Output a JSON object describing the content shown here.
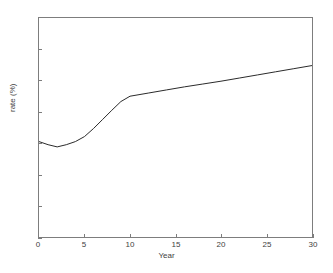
{
  "chart_data": {
    "type": "line",
    "title": "",
    "xlabel": "Year",
    "ylabel": "rate (%)",
    "xlim": [
      0,
      30
    ],
    "ylim": [
      4.7,
      5.4
    ],
    "grid": false,
    "legend": null,
    "line_color": "#2b2b2b",
    "axis_color": "#7d7d7d",
    "background_color": "#ffffff",
    "xticks": [
      0,
      5,
      10,
      15,
      20,
      25,
      30
    ],
    "xticklabels": [
      "0",
      "5",
      "10",
      "15",
      "20",
      "25",
      "30"
    ],
    "yticks": [
      4.7,
      4.8,
      4.9,
      5.0,
      5.1,
      5.2,
      5.3,
      5.4
    ],
    "yticklabels": [
      "4.7",
      "4.8",
      "4.9",
      "5",
      "5.1",
      "5.2",
      "5.3",
      "5.4"
    ],
    "series": [
      {
        "name": "rate",
        "x": [
          0,
          1,
          2,
          3,
          4,
          5,
          6,
          7,
          8,
          9,
          10,
          12,
          14,
          16,
          18,
          20,
          22,
          24,
          26,
          28,
          30
        ],
        "values": [
          5.005,
          4.995,
          4.988,
          4.995,
          5.005,
          5.021,
          5.047,
          5.076,
          5.105,
          5.133,
          5.15,
          5.16,
          5.17,
          5.18,
          5.189,
          5.198,
          5.208,
          5.218,
          5.228,
          5.238,
          5.248
        ]
      }
    ]
  },
  "figure": {
    "ylabel_text": "rate (%)",
    "xlabel_text": "Year"
  }
}
